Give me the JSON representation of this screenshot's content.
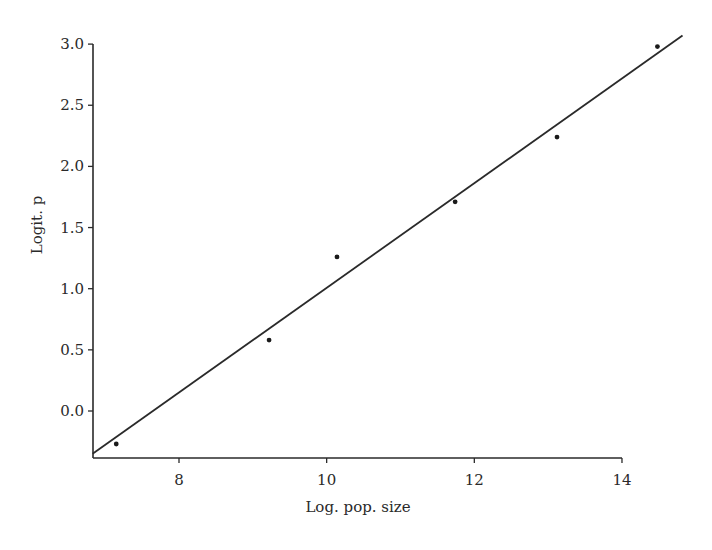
{
  "chart_data": {
    "type": "scatter",
    "title": "",
    "xlabel": "Log. pop. size",
    "ylabel": "Logit. p",
    "xlim": [
      6.83,
      14.0
    ],
    "ylim": [
      -0.38,
      3.0
    ],
    "grid": false,
    "legend": null,
    "x_ticks": [
      8,
      10,
      12,
      14
    ],
    "x_tick_labels": [
      "8",
      "10",
      "12",
      "14"
    ],
    "y_ticks": [
      0.0,
      0.5,
      1.0,
      1.5,
      2.0,
      2.5,
      3.0
    ],
    "y_tick_labels": [
      "0.0",
      "0.5",
      "1.0",
      "1.5",
      "2.0",
      "2.5",
      "3.0"
    ],
    "series": [
      {
        "name": "observed",
        "type": "scatter",
        "x": [
          7.15,
          9.22,
          10.14,
          11.74,
          13.12,
          14.48
        ],
        "y": [
          -0.27,
          0.58,
          1.26,
          1.71,
          2.24,
          2.98
        ]
      },
      {
        "name": "fitted line",
        "type": "line",
        "x": [
          6.83,
          14.82
        ],
        "y": [
          -0.35,
          3.07
        ]
      }
    ]
  },
  "axes": {
    "x_label": "Log. pop. size",
    "y_label": "Logit. p"
  }
}
